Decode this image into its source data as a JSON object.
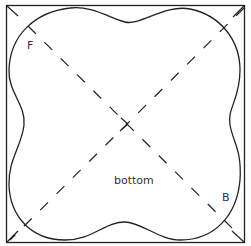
{
  "diagram": {
    "labels": {
      "top_left": "F",
      "center": "bottom",
      "bottom_right": "B"
    },
    "colors": {
      "stroke": "#222222",
      "label": "#333333",
      "background": "#ffffff"
    }
  }
}
